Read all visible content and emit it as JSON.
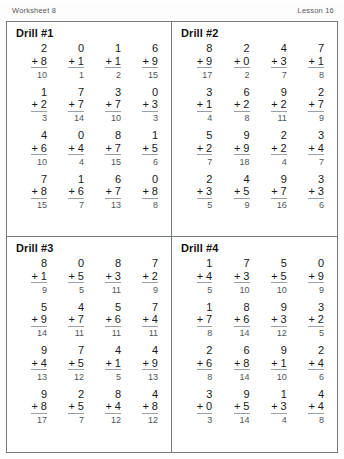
{
  "header": {
    "left": "Worksheet 8",
    "right": "Lesson 16"
  },
  "operator": "+",
  "drills": [
    {
      "title": "Drill #1",
      "rows": [
        {
          "addends": [
            2,
            0,
            1,
            6
          ],
          "plus": [
            8,
            1,
            1,
            9
          ],
          "sums": [
            10,
            1,
            2,
            15
          ]
        },
        {
          "addends": [
            1,
            7,
            3,
            0
          ],
          "plus": [
            2,
            7,
            7,
            3
          ],
          "sums": [
            3,
            14,
            10,
            3
          ]
        },
        {
          "addends": [
            4,
            0,
            8,
            1
          ],
          "plus": [
            6,
            4,
            7,
            5
          ],
          "sums": [
            10,
            4,
            15,
            6
          ]
        },
        {
          "addends": [
            7,
            1,
            6,
            0
          ],
          "plus": [
            8,
            6,
            7,
            8
          ],
          "sums": [
            15,
            7,
            13,
            8
          ]
        }
      ]
    },
    {
      "title": "Drill #2",
      "rows": [
        {
          "addends": [
            8,
            2,
            4,
            7
          ],
          "plus": [
            9,
            0,
            3,
            1
          ],
          "sums": [
            17,
            2,
            7,
            8
          ]
        },
        {
          "addends": [
            3,
            6,
            9,
            2
          ],
          "plus": [
            1,
            2,
            2,
            7
          ],
          "sums": [
            4,
            8,
            11,
            9
          ]
        },
        {
          "addends": [
            5,
            9,
            2,
            3
          ],
          "plus": [
            2,
            9,
            2,
            4
          ],
          "sums": [
            7,
            18,
            4,
            7
          ]
        },
        {
          "addends": [
            2,
            4,
            9,
            3
          ],
          "plus": [
            3,
            5,
            7,
            3
          ],
          "sums": [
            5,
            9,
            16,
            6
          ]
        }
      ]
    },
    {
      "title": "Drill #3",
      "rows": [
        {
          "addends": [
            8,
            0,
            8,
            7
          ],
          "plus": [
            1,
            5,
            3,
            2
          ],
          "sums": [
            9,
            5,
            11,
            9
          ]
        },
        {
          "addends": [
            5,
            4,
            5,
            7
          ],
          "plus": [
            9,
            7,
            6,
            4
          ],
          "sums": [
            14,
            11,
            11,
            11
          ]
        },
        {
          "addends": [
            9,
            7,
            4,
            4
          ],
          "plus": [
            4,
            5,
            1,
            9
          ],
          "sums": [
            13,
            12,
            5,
            13
          ]
        },
        {
          "addends": [
            9,
            2,
            8,
            4
          ],
          "plus": [
            8,
            5,
            4,
            8
          ],
          "sums": [
            17,
            7,
            12,
            12
          ]
        }
      ]
    },
    {
      "title": "Drill #4",
      "rows": [
        {
          "addends": [
            1,
            7,
            5,
            0
          ],
          "plus": [
            4,
            3,
            5,
            9
          ],
          "sums": [
            5,
            10,
            10,
            9
          ]
        },
        {
          "addends": [
            1,
            8,
            9,
            3
          ],
          "plus": [
            7,
            6,
            3,
            2
          ],
          "sums": [
            8,
            14,
            12,
            5
          ]
        },
        {
          "addends": [
            2,
            6,
            9,
            2
          ],
          "plus": [
            6,
            8,
            1,
            4
          ],
          "sums": [
            8,
            14,
            10,
            6
          ]
        },
        {
          "addends": [
            3,
            9,
            1,
            4
          ],
          "plus": [
            0,
            5,
            3,
            4
          ],
          "sums": [
            3,
            14,
            4,
            8
          ]
        }
      ]
    }
  ]
}
